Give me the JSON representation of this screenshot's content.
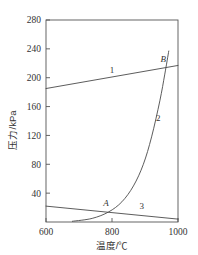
{
  "chart_data": {
    "type": "line",
    "title": "",
    "xlabel": "温度/℃",
    "ylabel": "压力/kPa",
    "xlim": [
      600,
      1000
    ],
    "ylim": [
      0,
      280
    ],
    "grid": false,
    "legend": "none",
    "xticks": [
      600,
      800,
      1000
    ],
    "xtick_labels": [
      "600",
      "800",
      "1000"
    ],
    "yticks": [
      40,
      80,
      120,
      160,
      200,
      240,
      280
    ],
    "ytick_labels": [
      "40",
      "80",
      "120",
      "160",
      "200",
      "240",
      "280"
    ],
    "series": [
      {
        "name": "1",
        "label": "1",
        "label_x": 800,
        "label_y": 207,
        "kind": "straight-line",
        "x": [
          600,
          1000
        ],
        "values": [
          185,
          217
        ]
      },
      {
        "name": "2",
        "label": "2",
        "label_x": 940,
        "label_y": 140,
        "kind": "exponential-curve",
        "x": [
          680,
          740,
          790,
          830,
          865,
          895,
          920,
          945,
          960,
          972
        ],
        "values": [
          1,
          5,
          14,
          28,
          50,
          80,
          118,
          168,
          205,
          237
        ]
      },
      {
        "name": "3",
        "label": "3",
        "label_x": 890,
        "label_y": 18,
        "kind": "straight-line",
        "x": [
          600,
          1000
        ],
        "values": [
          22,
          4
        ]
      }
    ],
    "annotations": [
      {
        "text": "A",
        "x": 782,
        "y": 22,
        "desc": "intersection of curve 2 and line 3"
      },
      {
        "text": "B",
        "x": 955,
        "y": 222,
        "desc": "intersection of curve 2 and line 1"
      }
    ]
  },
  "colors": {
    "axis": "#555555",
    "curve": "#4a4a4a",
    "text": "#333333",
    "background": "#ffffff"
  }
}
